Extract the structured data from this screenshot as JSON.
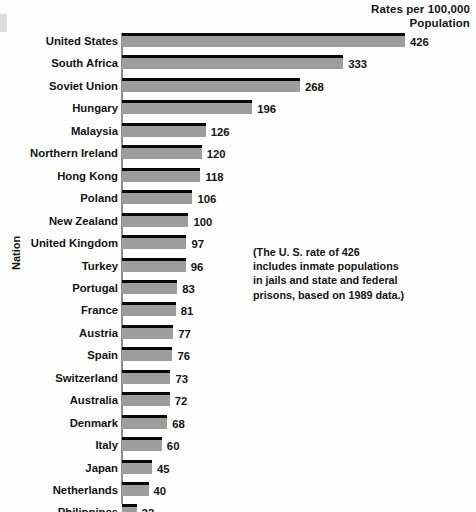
{
  "chart_data": {
    "type": "bar",
    "orientation": "horizontal",
    "title": "Rates per 100,000 Population",
    "title_lines": [
      "Rates per 100,000",
      "Population"
    ],
    "xlabel": "",
    "ylabel": "Nation",
    "xlim": [
      0,
      426
    ],
    "grid": false,
    "legend": null,
    "categories": [
      "United States",
      "South Africa",
      "Soviet Union",
      "Hungary",
      "Malaysia",
      "Northern Ireland",
      "Hong Kong",
      "Poland",
      "New Zealand",
      "United Kingdom",
      "Turkey",
      "Portugal",
      "France",
      "Austria",
      "Spain",
      "Switzerland",
      "Australia",
      "Denmark",
      "Italy",
      "Japan",
      "Netherlands",
      "Philippines"
    ],
    "values": [
      426,
      333,
      268,
      196,
      126,
      120,
      118,
      106,
      100,
      97,
      96,
      83,
      81,
      77,
      76,
      73,
      72,
      68,
      60,
      45,
      40,
      22
    ],
    "bar_color": "#9d9d9d",
    "bar_edge_color": "#070707",
    "annotations": [
      "(The U. S. rate of 426",
      "includes inmate populations",
      "in jails and state and federal",
      "prisons, based on 1989 data.)"
    ]
  },
  "rows": [
    {
      "label": "United States",
      "value": "426"
    },
    {
      "label": "South Africa",
      "value": "333"
    },
    {
      "label": "Soviet Union",
      "value": "268"
    },
    {
      "label": "Hungary",
      "value": "196"
    },
    {
      "label": "Malaysia",
      "value": "126"
    },
    {
      "label": "Northern Ireland",
      "value": "120"
    },
    {
      "label": "Hong Kong",
      "value": "118"
    },
    {
      "label": "Poland",
      "value": "106"
    },
    {
      "label": "New Zealand",
      "value": "100"
    },
    {
      "label": "United Kingdom",
      "value": "97"
    },
    {
      "label": "Turkey",
      "value": "96"
    },
    {
      "label": "Portugal",
      "value": "83"
    },
    {
      "label": "France",
      "value": "81"
    },
    {
      "label": "Austria",
      "value": "77"
    },
    {
      "label": "Spain",
      "value": "76"
    },
    {
      "label": "Switzerland",
      "value": "73"
    },
    {
      "label": "Australia",
      "value": "72"
    },
    {
      "label": "Denmark",
      "value": "68"
    },
    {
      "label": "Italy",
      "value": "60"
    },
    {
      "label": "Japan",
      "value": "45"
    },
    {
      "label": "Netherlands",
      "value": "40"
    },
    {
      "label": "Philippines",
      "value": "22"
    }
  ],
  "header": {
    "line1": "Rates per 100,000",
    "line2": "Population"
  },
  "axis": {
    "y_title": "Nation"
  },
  "note": {
    "line1": "(The U. S. rate of 426",
    "line2": "includes inmate populations",
    "line3": "in jails and state and federal",
    "line4": "prisons, based on 1989 data.)"
  }
}
